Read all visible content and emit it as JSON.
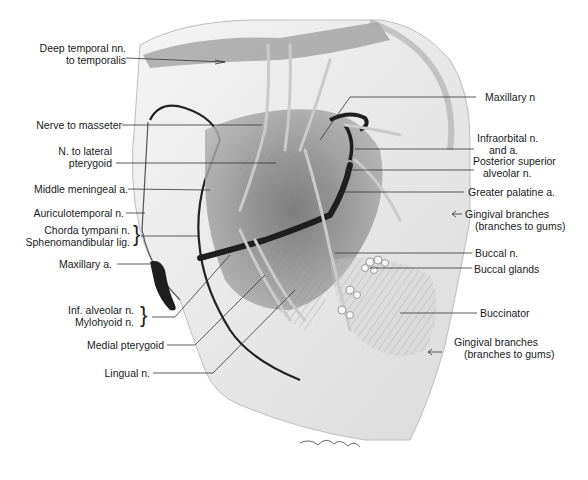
{
  "figure": {
    "style": "grayscale pencil illustration",
    "signature": "signature-mark"
  },
  "labels_left": [
    {
      "id": "deep-temporal",
      "lines": [
        "Deep temporal nn.",
        "to temporalis"
      ]
    },
    {
      "id": "nerve-masseter",
      "lines": [
        "Nerve to masseter"
      ]
    },
    {
      "id": "n-lateral-pterygoid",
      "lines": [
        "N. to lateral",
        "pterygoid"
      ]
    },
    {
      "id": "middle-meningeal",
      "lines": [
        "Middle meningeal a."
      ]
    },
    {
      "id": "auriculotemporal",
      "lines": [
        "Auriculotemporal n."
      ]
    },
    {
      "id": "chorda-spheno",
      "lines": [
        "Chorda tympani n.",
        "Sphenomandibular lig."
      ]
    },
    {
      "id": "maxillary-a",
      "lines": [
        "Maxillary a."
      ]
    },
    {
      "id": "inf-alveolar-mylohyoid",
      "lines": [
        "Inf. alveolar n.",
        "Mylohyoid n."
      ]
    },
    {
      "id": "medial-pterygoid",
      "lines": [
        "Medial pterygoid"
      ]
    },
    {
      "id": "lingual",
      "lines": [
        "Lingual n."
      ]
    }
  ],
  "labels_right": [
    {
      "id": "maxillary-n",
      "lines": [
        "Maxillary n"
      ]
    },
    {
      "id": "infraorbital",
      "lines": [
        "Infraorbital n.",
        "and a."
      ]
    },
    {
      "id": "post-sup-alveolar",
      "lines": [
        "Posterior superior",
        "alveolar n."
      ]
    },
    {
      "id": "greater-palatine",
      "lines": [
        "Greater palatine a."
      ]
    },
    {
      "id": "gingival-upper",
      "lines": [
        "Gingival branches",
        "(branches to gums)"
      ]
    },
    {
      "id": "buccal-n",
      "lines": [
        "Buccal n."
      ]
    },
    {
      "id": "buccal-glands",
      "lines": [
        "Buccal glands"
      ]
    },
    {
      "id": "buccinator",
      "lines": [
        "Buccinator"
      ]
    },
    {
      "id": "gingival-lower",
      "lines": [
        "Gingival branches",
        "(branches to gums)"
      ]
    }
  ],
  "colors": {
    "ink": "#1a1a1a",
    "leader": "#333333",
    "bone": "#ededed",
    "muscle": "#9a9a9a",
    "artery": "#2a2a2a",
    "nerve": "#c8c8c8"
  }
}
